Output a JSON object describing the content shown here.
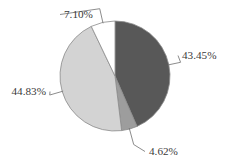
{
  "chart_data": {
    "type": "pie",
    "title": "",
    "subtitle": "",
    "xlabel": "",
    "ylabel": "",
    "grid": false,
    "legend_position": "none",
    "labels_as_shown": [
      "43.45%",
      "4.62%",
      "44.83%",
      "7.10%"
    ],
    "categories": [
      "Segment 1",
      "Segment 2",
      "Segment 3",
      "Segment 4"
    ],
    "values": [
      43.45,
      4.62,
      44.83,
      7.1
    ],
    "slices": [
      {
        "label": "43.45%",
        "value": 43.45,
        "color": "#585858",
        "label_position": "right",
        "leader_line": true
      },
      {
        "label": "4.62%",
        "value": 4.62,
        "color": "#9d9d9d",
        "label_position": "bottom",
        "leader_line": true
      },
      {
        "label": "44.83%",
        "value": 44.83,
        "color": "#d3d3d3",
        "label_position": "left",
        "leader_line": true
      },
      {
        "label": "7.10%",
        "value": 7.1,
        "color": "#ffffff",
        "label_position": "top",
        "leader_line": true
      }
    ],
    "start_angle_deg": 0,
    "direction": "clockwise",
    "total": 100.0,
    "outline_color": "#8a8a8a",
    "label_text_color": "#3a3a3a",
    "background_color": "#ffffff"
  },
  "geometry": {
    "center_x": 115,
    "center_y": 76,
    "radius": 55
  }
}
